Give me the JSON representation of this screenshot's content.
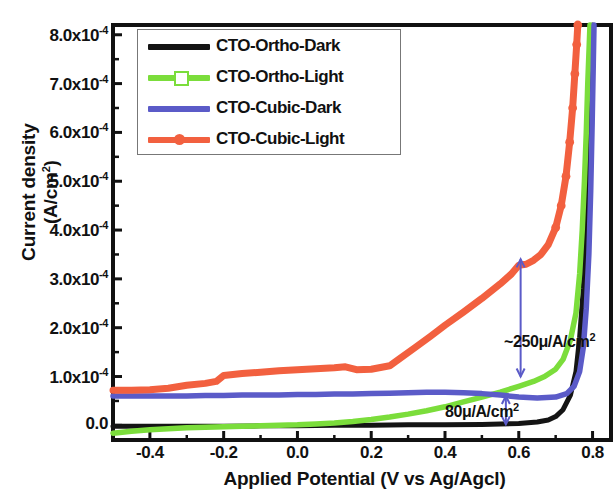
{
  "chart_data": {
    "type": "line",
    "title": "",
    "xlabel": "Applied Potential (V vs Ag/Agcl)",
    "ylabel": "Current density (A/cm2)",
    "ylabel_display": "Current density (A/cm",
    "ylabel_sup": "2",
    "ylabel_tail": ")",
    "xlim": [
      -0.5,
      0.85
    ],
    "ylim": [
      -3e-05,
      0.00082
    ],
    "xticks": [
      -0.4,
      -0.2,
      0.0,
      0.2,
      0.4,
      0.6,
      0.8
    ],
    "xticklabels": [
      "-0.4",
      "-0.2",
      "0.0",
      "0.2",
      "0.4",
      "0.6",
      "0.8"
    ],
    "yticks": [
      0.0,
      0.0001,
      0.0002,
      0.0003,
      0.0004,
      0.0005,
      0.0006,
      0.0007,
      0.0008
    ],
    "yticklabels": [
      "0.0",
      "1.0x10",
      "2.0x10",
      "3.0x10",
      "4.0x10",
      "5.0x10",
      "6.0x10",
      "7.0x10",
      "8.0x10"
    ],
    "ytick_exponent": "-4",
    "grid": false,
    "legend_position": "upper-left",
    "series": [
      {
        "name": "CTO-Ortho-Dark",
        "color": "#141414",
        "marker": "none",
        "points": [
          [
            -0.5,
            -2e-06
          ],
          [
            -0.4,
            -2e-06
          ],
          [
            -0.3,
            -2e-06
          ],
          [
            -0.2,
            -2e-06
          ],
          [
            -0.1,
            -1e-06
          ],
          [
            0.0,
            -1e-06
          ],
          [
            0.1,
            0.0
          ],
          [
            0.2,
            0.0
          ],
          [
            0.3,
            1e-06
          ],
          [
            0.4,
            1e-06
          ],
          [
            0.5,
            2e-06
          ],
          [
            0.55,
            3e-06
          ],
          [
            0.6,
            4e-06
          ],
          [
            0.65,
            7e-06
          ],
          [
            0.68,
            1.1e-05
          ],
          [
            0.7,
            1.8e-05
          ],
          [
            0.72,
            3.2e-05
          ],
          [
            0.74,
            6.2e-05
          ],
          [
            0.755,
            0.00011
          ],
          [
            0.765,
            0.00018
          ],
          [
            0.775,
            0.00028
          ],
          [
            0.782,
            0.0004
          ],
          [
            0.788,
            0.00054
          ],
          [
            0.793,
            0.00067
          ],
          [
            0.797,
            0.00076
          ],
          [
            0.8,
            0.00082
          ]
        ]
      },
      {
        "name": "CTO-Ortho-Light",
        "color": "#7BDD3B",
        "marker": "open-square",
        "points": [
          [
            -0.5,
            -1.6e-05
          ],
          [
            -0.45,
            -1.2e-05
          ],
          [
            -0.4,
            -9e-06
          ],
          [
            -0.35,
            -7e-06
          ],
          [
            -0.3,
            -5e-06
          ],
          [
            -0.25,
            -4e-06
          ],
          [
            -0.2,
            -3e-06
          ],
          [
            -0.15,
            -2e-06
          ],
          [
            -0.1,
            -1e-06
          ],
          [
            -0.05,
            0.0
          ],
          [
            0.0,
            1e-06
          ],
          [
            0.05,
            3e-06
          ],
          [
            0.1,
            5e-06
          ],
          [
            0.15,
            8e-06
          ],
          [
            0.2,
            1.2e-05
          ],
          [
            0.25,
            1.7e-05
          ],
          [
            0.3,
            2.3e-05
          ],
          [
            0.35,
            3e-05
          ],
          [
            0.4,
            3.8e-05
          ],
          [
            0.45,
            4.8e-05
          ],
          [
            0.5,
            5.8e-05
          ],
          [
            0.55,
            6.8e-05
          ],
          [
            0.6,
            8e-05
          ],
          [
            0.64,
            9e-05
          ],
          [
            0.67,
            0.0001
          ],
          [
            0.7,
            0.000115
          ],
          [
            0.72,
            0.000135
          ],
          [
            0.74,
            0.000175
          ],
          [
            0.755,
            0.00023
          ],
          [
            0.765,
            0.00031
          ],
          [
            0.772,
            0.0004
          ],
          [
            0.778,
            0.0005
          ],
          [
            0.783,
            0.0006
          ],
          [
            0.787,
            0.0007
          ],
          [
            0.791,
            0.00078
          ],
          [
            0.793,
            0.00082
          ]
        ]
      },
      {
        "name": "CTO-Cubic-Dark",
        "color": "#5B5BC8",
        "marker": "none",
        "points": [
          [
            -0.5,
            6e-05
          ],
          [
            -0.4,
            6e-05
          ],
          [
            -0.35,
            6e-05
          ],
          [
            -0.3,
            6e-05
          ],
          [
            -0.25,
            6.1e-05
          ],
          [
            -0.2,
            6.1e-05
          ],
          [
            -0.15,
            6.2e-05
          ],
          [
            -0.1,
            6.2e-05
          ],
          [
            -0.05,
            6.2e-05
          ],
          [
            0.0,
            6.3e-05
          ],
          [
            0.05,
            6.3e-05
          ],
          [
            0.1,
            6.4e-05
          ],
          [
            0.15,
            6.4e-05
          ],
          [
            0.2,
            6.5e-05
          ],
          [
            0.25,
            6.6e-05
          ],
          [
            0.3,
            6.7e-05
          ],
          [
            0.35,
            6.8e-05
          ],
          [
            0.4,
            6.8e-05
          ],
          [
            0.45,
            6.7e-05
          ],
          [
            0.5,
            6.5e-05
          ],
          [
            0.55,
            6.2e-05
          ],
          [
            0.6,
            5.8e-05
          ],
          [
            0.65,
            5.6e-05
          ],
          [
            0.7,
            5.8e-05
          ],
          [
            0.73,
            6.5e-05
          ],
          [
            0.75,
            8e-05
          ],
          [
            0.765,
            0.00011
          ],
          [
            0.775,
            0.00016
          ],
          [
            0.783,
            0.00024
          ],
          [
            0.79,
            0.00035
          ],
          [
            0.795,
            0.00048
          ],
          [
            0.799,
            0.00062
          ],
          [
            0.802,
            0.00074
          ],
          [
            0.804,
            0.00082
          ]
        ]
      },
      {
        "name": "CTO-Cubic-Light",
        "color": "#F2603F",
        "marker": "filled-circle",
        "points": [
          [
            -0.5,
            7.2e-05
          ],
          [
            -0.45,
            7.2e-05
          ],
          [
            -0.4,
            7.3e-05
          ],
          [
            -0.35,
            7.6e-05
          ],
          [
            -0.3,
            8.2e-05
          ],
          [
            -0.25,
            8.6e-05
          ],
          [
            -0.22,
            9e-05
          ],
          [
            -0.2,
            0.000102
          ],
          [
            -0.15,
            0.000106
          ],
          [
            -0.1,
            0.000109
          ],
          [
            -0.05,
            0.000112
          ],
          [
            0.0,
            0.000114
          ],
          [
            0.05,
            0.000116
          ],
          [
            0.1,
            0.000118
          ],
          [
            0.13,
            0.00012
          ],
          [
            0.16,
            0.000114
          ],
          [
            0.2,
            0.000115
          ],
          [
            0.25,
            0.000122
          ],
          [
            0.28,
            0.000138
          ],
          [
            0.32,
            0.00016
          ],
          [
            0.36,
            0.000182
          ],
          [
            0.4,
            0.000205
          ],
          [
            0.45,
            0.000232
          ],
          [
            0.5,
            0.00026
          ],
          [
            0.55,
            0.00029
          ],
          [
            0.58,
            0.00031
          ],
          [
            0.6,
            0.000328
          ],
          [
            0.62,
            0.00033
          ],
          [
            0.64,
            0.000338
          ],
          [
            0.66,
            0.00035
          ],
          [
            0.68,
            0.00037
          ],
          [
            0.7,
            0.000405
          ],
          [
            0.715,
            0.00045
          ],
          [
            0.728,
            0.00051
          ],
          [
            0.738,
            0.00058
          ],
          [
            0.746,
            0.00065
          ],
          [
            0.752,
            0.00072
          ],
          [
            0.757,
            0.00078
          ],
          [
            0.76,
            0.00082
          ]
        ]
      }
    ],
    "annotations": [
      {
        "text": "~250μ/A/cm",
        "sup": "2",
        "name": "annotation-250",
        "x": 0.56,
        "y": 0.000172,
        "arrow": {
          "x": 0.605,
          "y_top": 0.00034,
          "y_bottom": 0.0001
        }
      },
      {
        "text": "80μ/A/cm",
        "sup": "2",
        "name": "annotation-80",
        "x": 0.4,
        "y": 3e-05,
        "arrow": {
          "x": 0.565,
          "y_top": 6e-05,
          "y_bottom": 2e-06
        }
      }
    ]
  },
  "legend": {
    "items": [
      {
        "label": "CTO-Ortho-Dark",
        "color": "#141414",
        "marker": "none"
      },
      {
        "label": "CTO-Ortho-Light",
        "color": "#7BDD3B",
        "marker": "open-square"
      },
      {
        "label": "CTO-Cubic-Dark",
        "color": "#5B5BC8",
        "marker": "none"
      },
      {
        "label": "CTO-Cubic-Light",
        "color": "#F2603F",
        "marker": "filled-circle"
      }
    ]
  }
}
